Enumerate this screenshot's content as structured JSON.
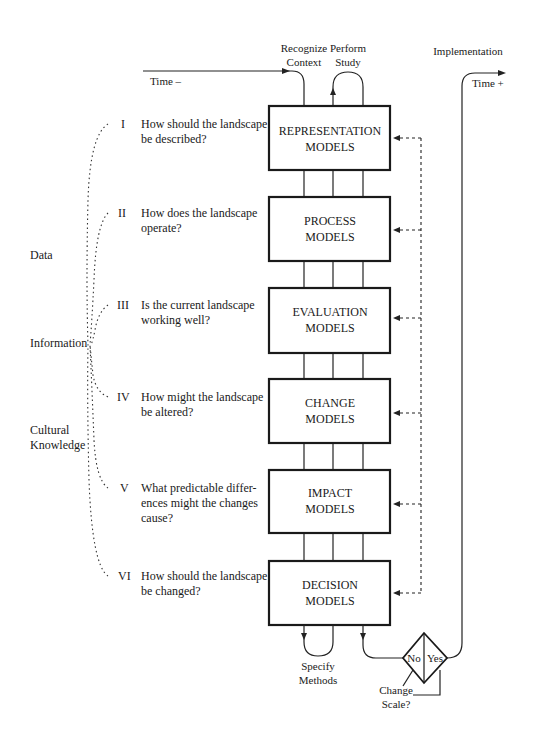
{
  "top_labels": {
    "recognize_line1": "Recognize",
    "recognize_line2": "Context",
    "perform_line1": "Perform",
    "perform_line2": "Study",
    "implementation": "Implementation",
    "time_minus": "Time –",
    "time_plus": "Time +"
  },
  "boxes": [
    {
      "line1": "REPRESENTATION",
      "line2": "MODELS"
    },
    {
      "line1": "PROCESS",
      "line2": "MODELS"
    },
    {
      "line1": "EVALUATION",
      "line2": "MODELS"
    },
    {
      "line1": "CHANGE",
      "line2": "MODELS"
    },
    {
      "line1": "IMPACT",
      "line2": "MODELS"
    },
    {
      "line1": "DECISION",
      "line2": "MODELS"
    }
  ],
  "questions": [
    {
      "numeral": "I",
      "lines": [
        "How should the landscape",
        "be described?"
      ]
    },
    {
      "numeral": "II",
      "lines": [
        "How does the landscape",
        "operate?"
      ]
    },
    {
      "numeral": "III",
      "lines": [
        "Is the current landscape",
        "working well?"
      ]
    },
    {
      "numeral": "IV",
      "lines": [
        "How might the landscape",
        "be altered?"
      ]
    },
    {
      "numeral": "V",
      "lines": [
        "What predictable differ-",
        "ences might the changes",
        "cause?"
      ]
    },
    {
      "numeral": "VI",
      "lines": [
        "How should the landscape",
        "be changed?"
      ]
    }
  ],
  "side_labels": {
    "data": "Data",
    "information": "Information",
    "cultural_line1": "Cultural",
    "cultural_line2": "Knowledge"
  },
  "bottom_labels": {
    "specify_line1": "Specify",
    "specify_line2": "Methods",
    "decision_no": "No",
    "decision_yes": "Yes",
    "change_line1": "Change",
    "change_line2": "Scale?"
  }
}
